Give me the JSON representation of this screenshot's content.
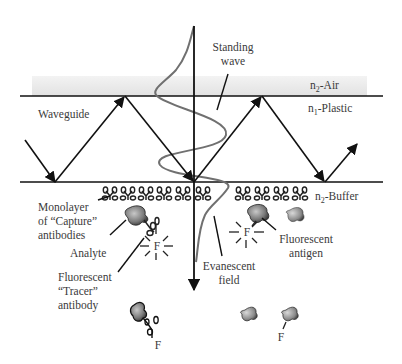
{
  "figure": {
    "type": "diagram"
  },
  "layers": {
    "air": {
      "label_prefix": "n",
      "label_sub": "2",
      "label_suffix": "-Air"
    },
    "plastic": {
      "label_prefix": "n",
      "label_sub": "1",
      "label_suffix": "-Plastic"
    },
    "buffer": {
      "label_prefix": "n",
      "label_sub": "2",
      "label_suffix": "-Buffer"
    }
  },
  "labels": {
    "waveguide": "Waveguide",
    "standing_wave_line1": "Standing",
    "standing_wave_line2": "wave",
    "monolayer_line1": "Monolayer",
    "monolayer_line2": "of “Capture”",
    "monolayer_line3": "antibodies",
    "analyte": "Analyte",
    "tracer_line1": "Fluorescent",
    "tracer_line2": "“Tracer”",
    "tracer_line3": "antibody",
    "evanescent_line1": "Evanescent",
    "evanescent_line2": "field",
    "fluor_antigen_line1": "Fluorescent",
    "fluor_antigen_line2": "antigen"
  },
  "fluorophore_marks": {
    "bound_tracer": "F",
    "bound_antigen": "F",
    "free_tracer": "F",
    "free_antigen": "F"
  },
  "colors": {
    "air_band": "#e8e8e8",
    "lines": "#111111",
    "standing_wave": "#707070",
    "text": "#3a3a3a",
    "analyte_fill": "#6f6f6f"
  }
}
